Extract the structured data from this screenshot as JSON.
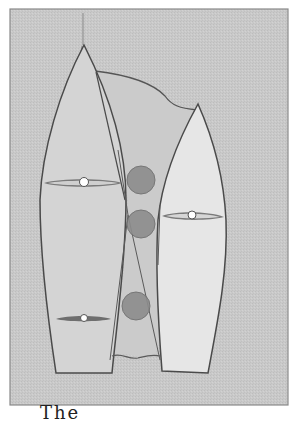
{
  "figure": {
    "colors": {
      "frame_background": "#c9c9c9",
      "frame_border": "#8a8a8a",
      "left_hull_fill": "#d4d4d4",
      "right_hull_fill": "#e6e6e6",
      "middle_region_fill": "#cbcbcb",
      "outline": "#4a4a4a",
      "circle_fill": "#8c8c8c",
      "circle_stroke": "#6e6e6e",
      "foil_fill": "#7a7a7a",
      "pivot_fill": "#ffffff"
    },
    "elements": {
      "left_hull": "left-hull",
      "right_hull": "right-hull",
      "middle_region": "overlap-region",
      "circles": 3,
      "foils": 3
    }
  },
  "caption": {
    "text": "The"
  }
}
